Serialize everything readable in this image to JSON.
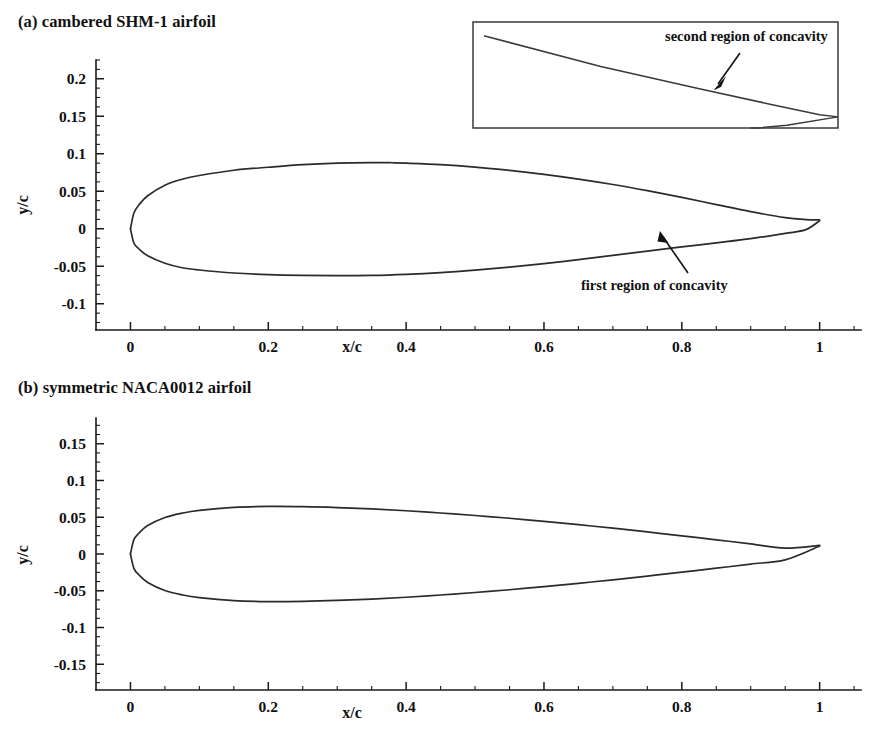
{
  "figure": {
    "panels": [
      {
        "id": "a",
        "title": "(a) cambered SHM-1 airfoil",
        "xlabel": "x/c",
        "ylabel": "y/c"
      },
      {
        "id": "b",
        "title": "(b) symmetric NACA0012 airfoil",
        "xlabel": "x/c",
        "ylabel": "y/c"
      }
    ],
    "annotations": {
      "first_concavity": "first region of concavity",
      "second_concavity": "second region of concavity"
    },
    "colors": {
      "curve": "#2b2b2b",
      "axis": "#1a1a1a",
      "text": "#111111",
      "background": "#ffffff"
    }
  },
  "ticks": {
    "panel_a": {
      "x_major": [
        "0",
        "0.2",
        "0.4",
        "0.6",
        "0.8",
        "1"
      ],
      "y_major": [
        "0.2",
        "0.15",
        "0.1",
        "0.05",
        "0",
        "-0.05",
        "-0.1"
      ]
    },
    "panel_b": {
      "x_major": [
        "0",
        "0.2",
        "0.4",
        "0.6",
        "0.8",
        "1"
      ],
      "y_major": [
        "0.15",
        "0.1",
        "0.05",
        "0",
        "-0.05",
        "-0.1",
        "-0.15"
      ]
    }
  },
  "chart_data": [
    {
      "type": "line",
      "title": "(a) cambered SHM-1 airfoil",
      "xlabel": "x/c",
      "ylabel": "y/c",
      "xlim": [
        -0.05,
        1.06
      ],
      "ylim": [
        -0.135,
        0.225
      ],
      "x_ticks": [
        0,
        0.2,
        0.4,
        0.6,
        0.8,
        1
      ],
      "y_ticks": [
        -0.1,
        -0.05,
        0,
        0.05,
        0.1,
        0.15,
        0.2
      ],
      "x_minor_step": 0.05,
      "y_minor_step": 0.0125,
      "grid": false,
      "legend": null,
      "annotations": [
        {
          "text": "first region of concavity",
          "text_xy": [
            0.76,
            -0.073
          ],
          "points_to_xy": [
            0.885,
            -0.021
          ]
        }
      ],
      "series": [
        {
          "name": "SHM-1 upper surface",
          "x": [
            0.0,
            0.005,
            0.0125,
            0.025,
            0.05,
            0.075,
            0.1,
            0.15,
            0.2,
            0.25,
            0.3,
            0.35,
            0.38,
            0.4,
            0.45,
            0.5,
            0.55,
            0.6,
            0.65,
            0.7,
            0.75,
            0.8,
            0.85,
            0.9,
            0.95,
            0.98,
            1.0
          ],
          "y": [
            0.0,
            0.021,
            0.032,
            0.044,
            0.058,
            0.066,
            0.071,
            0.078,
            0.082,
            0.0855,
            0.0875,
            0.0882,
            0.088,
            0.0875,
            0.0855,
            0.0822,
            0.0778,
            0.0725,
            0.0662,
            0.059,
            0.0508,
            0.0418,
            0.0322,
            0.0228,
            0.0148,
            0.0122,
            0.0118
          ]
        },
        {
          "name": "SHM-1 lower surface",
          "x": [
            0.0,
            0.005,
            0.0125,
            0.025,
            0.05,
            0.075,
            0.1,
            0.15,
            0.2,
            0.25,
            0.3,
            0.35,
            0.4,
            0.45,
            0.5,
            0.55,
            0.6,
            0.65,
            0.7,
            0.75,
            0.8,
            0.85,
            0.9,
            0.95,
            0.98,
            1.0
          ],
          "y": [
            0.0,
            -0.019,
            -0.027,
            -0.036,
            -0.046,
            -0.052,
            -0.055,
            -0.059,
            -0.0612,
            -0.0622,
            -0.0625,
            -0.0622,
            -0.0608,
            -0.0585,
            -0.0552,
            -0.0512,
            -0.0465,
            -0.0412,
            -0.0355,
            -0.0298,
            -0.0242,
            -0.0188,
            -0.0132,
            -0.0062,
            -0.0012,
            0.0108
          ]
        }
      ]
    },
    {
      "type": "line",
      "title": "(b) symmetric NACA0012 airfoil",
      "xlabel": "x/c",
      "ylabel": "y/c",
      "xlim": [
        -0.05,
        1.06
      ],
      "ylim": [
        -0.185,
        0.185
      ],
      "x_ticks": [
        0,
        0.2,
        0.4,
        0.6,
        0.8,
        1
      ],
      "y_ticks": [
        -0.15,
        -0.1,
        -0.05,
        0,
        0.05,
        0.1,
        0.15
      ],
      "x_minor_step": 0.05,
      "y_minor_step": 0.0125,
      "grid": false,
      "legend": null,
      "annotations": [],
      "series": [
        {
          "name": "NACA0012 upper surface",
          "x": [
            0.0,
            0.005,
            0.0125,
            0.025,
            0.05,
            0.075,
            0.1,
            0.15,
            0.2,
            0.25,
            0.3,
            0.35,
            0.4,
            0.45,
            0.5,
            0.55,
            0.6,
            0.65,
            0.7,
            0.75,
            0.8,
            0.85,
            0.9,
            0.95,
            1.0
          ],
          "y": [
            0.0,
            0.0195,
            0.0286,
            0.0387,
            0.0496,
            0.0556,
            0.0594,
            0.0634,
            0.0647,
            0.0644,
            0.0632,
            0.0613,
            0.0588,
            0.0558,
            0.0524,
            0.0486,
            0.0444,
            0.0399,
            0.0351,
            0.03,
            0.0247,
            0.0193,
            0.0137,
            0.0079,
            0.0118
          ]
        },
        {
          "name": "NACA0012 lower surface",
          "x": [
            0.0,
            0.005,
            0.0125,
            0.025,
            0.05,
            0.075,
            0.1,
            0.15,
            0.2,
            0.25,
            0.3,
            0.35,
            0.4,
            0.45,
            0.5,
            0.55,
            0.6,
            0.65,
            0.7,
            0.75,
            0.8,
            0.85,
            0.9,
            0.95,
            1.0
          ],
          "y": [
            0.0,
            -0.0195,
            -0.0286,
            -0.0387,
            -0.0496,
            -0.0556,
            -0.0594,
            -0.0634,
            -0.0647,
            -0.0644,
            -0.0632,
            -0.0613,
            -0.0588,
            -0.0558,
            -0.0524,
            -0.0486,
            -0.0444,
            -0.0399,
            -0.0351,
            -0.03,
            -0.0247,
            -0.0193,
            -0.0137,
            -0.0079,
            0.0108
          ]
        }
      ]
    },
    {
      "type": "line",
      "title": "inset: magnified SHM-1 trailing edge",
      "xlabel": "",
      "ylabel": "",
      "grid": false,
      "legend": null,
      "annotations": [
        {
          "text": "second region of concavity",
          "points_to_xy": [
            0.62,
            0.36
          ]
        }
      ],
      "series": [
        {
          "name": "inset upper surface",
          "x": [
            0.03,
            0.35,
            0.62,
            0.82,
            0.95,
            1.0
          ],
          "y": [
            0.13,
            0.42,
            0.63,
            0.78,
            0.875,
            0.895
          ]
        },
        {
          "name": "inset lower surface",
          "x": [
            1.0,
            0.86,
            0.78,
            0.76
          ],
          "y": [
            0.895,
            0.975,
            1.0,
            1.0
          ]
        }
      ]
    }
  ]
}
